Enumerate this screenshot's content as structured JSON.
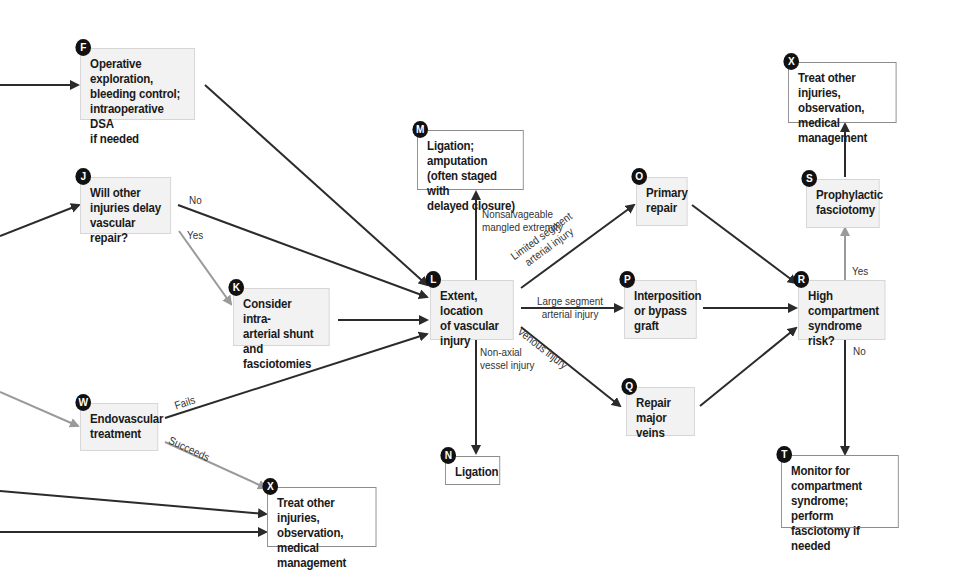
{
  "diagram": {
    "type": "flowchart",
    "nodes": [
      {
        "id": "F",
        "badge": "F",
        "text": "Operative exploration,\nbleeding control;\nintraoperative DSA\nif needed",
        "style": "process"
      },
      {
        "id": "J",
        "badge": "J",
        "text": "Will other\ninjuries delay\nvascular repair?",
        "style": "process"
      },
      {
        "id": "K",
        "badge": "K",
        "text": "Consider intra-\narterial shunt and\nfasciotomies",
        "style": "process"
      },
      {
        "id": "W",
        "badge": "W",
        "text": "Endovascular\ntreatment",
        "style": "process"
      },
      {
        "id": "X1",
        "badge": "X",
        "text": "Treat other injuries,\nobservation, medical\nmanagement",
        "style": "terminal"
      },
      {
        "id": "M",
        "badge": "M",
        "text": "Ligation; amputation\n(often staged with\ndelayed closure)",
        "style": "terminal"
      },
      {
        "id": "L",
        "badge": "L",
        "text": "Extent, location\nof vascular\ninjury",
        "style": "process"
      },
      {
        "id": "N",
        "badge": "N",
        "text": "Ligation",
        "style": "terminal"
      },
      {
        "id": "O",
        "badge": "O",
        "text": "Primary\nrepair",
        "style": "process"
      },
      {
        "id": "P",
        "badge": "P",
        "text": "Interposition\nor bypass\ngraft",
        "style": "process"
      },
      {
        "id": "Q",
        "badge": "Q",
        "text": "Repair\nmajor veins",
        "style": "process"
      },
      {
        "id": "R",
        "badge": "R",
        "text": "High\ncompartment\nsyndrome risk?",
        "style": "process"
      },
      {
        "id": "S",
        "badge": "S",
        "text": "Prophylactic\nfasciotomy",
        "style": "process"
      },
      {
        "id": "X2",
        "badge": "X",
        "text": "Treat other injuries,\nobservation, medical\nmanagement",
        "style": "terminal"
      },
      {
        "id": "T",
        "badge": "T",
        "text": "Monitor for\ncompartment syndrome;\nperform fasciotomy if\nneeded",
        "style": "terminal"
      }
    ],
    "edge_labels": {
      "j_no": "No",
      "j_yes": "Yes",
      "w_fails": "Fails",
      "w_succeeds": "Succeeds",
      "l_nonsalvageable": "Nonsalvageable\nmangled extremity",
      "l_limited": "Limited segment\narterial injury",
      "l_large": "Large segment\narterial injury",
      "l_venous": "Venous injury",
      "l_nonaxial": "Non-axial\nvessel injury",
      "r_yes": "Yes",
      "r_no": "No"
    },
    "edges": [
      {
        "from": "(offscreen)",
        "to": "F"
      },
      {
        "from": "(offscreen)",
        "to": "J"
      },
      {
        "from": "(offscreen)",
        "to": "W",
        "color": "gray"
      },
      {
        "from": "(offscreen)",
        "to": "X1"
      },
      {
        "from": "(offscreen)",
        "to": "X1"
      },
      {
        "from": "F",
        "to": "L"
      },
      {
        "from": "J",
        "to": "L",
        "label": "No"
      },
      {
        "from": "J",
        "to": "K",
        "label": "Yes",
        "color": "gray"
      },
      {
        "from": "K",
        "to": "L"
      },
      {
        "from": "W",
        "to": "L",
        "label": "Fails"
      },
      {
        "from": "W",
        "to": "X1",
        "label": "Succeeds",
        "color": "gray"
      },
      {
        "from": "L",
        "to": "M",
        "label": "Nonsalvageable mangled extremity"
      },
      {
        "from": "L",
        "to": "O",
        "label": "Limited segment arterial injury"
      },
      {
        "from": "L",
        "to": "P",
        "label": "Large segment arterial injury"
      },
      {
        "from": "L",
        "to": "Q",
        "label": "Venous injury"
      },
      {
        "from": "L",
        "to": "N",
        "label": "Non-axial vessel injury"
      },
      {
        "from": "O",
        "to": "R"
      },
      {
        "from": "P",
        "to": "R"
      },
      {
        "from": "Q",
        "to": "R"
      },
      {
        "from": "R",
        "to": "S",
        "label": "Yes",
        "color": "gray"
      },
      {
        "from": "S",
        "to": "X2"
      },
      {
        "from": "R",
        "to": "T",
        "label": "No"
      }
    ],
    "colors": {
      "process_fill": "#f2f2f2",
      "process_border": "#d6d6d6",
      "terminal_fill": "#ffffff",
      "terminal_border": "#8c8c8c",
      "edge_dark": "#2b2b2b",
      "edge_gray": "#9a9a9a",
      "badge": "#111111"
    }
  }
}
